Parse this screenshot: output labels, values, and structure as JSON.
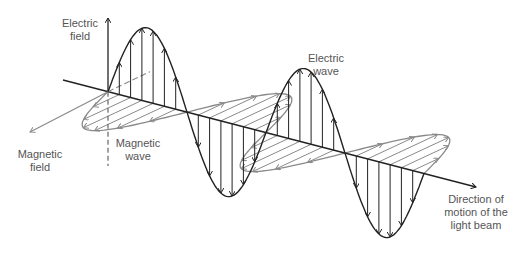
{
  "labels": {
    "electric_field": "Electric\nfield",
    "magnetic_field": "Magnetic\nfield",
    "magnetic_wave": "Magnetic\nwave",
    "electric_wave": "Electric\nwave",
    "direction": "Direction of\nmotion of the\nlight beam"
  },
  "colors": {
    "electric": "#222222",
    "magnetic": "#8a8a8a",
    "axis": "#222222",
    "text": "#555555"
  },
  "geometry": {
    "axis_start": [
      63,
      80
    ],
    "axis_end": [
      476,
      187
    ],
    "origin_x": 108,
    "half_period_x": 79,
    "half_cycles": 4,
    "electric_amplitude": 74,
    "magnetic_vector": [
      -60,
      28
    ],
    "electric_axis_top": [
      108,
      18
    ],
    "electric_axis_bottom": [
      108,
      166
    ],
    "magnetic_axis_end": [
      30,
      132
    ],
    "arrows_per_half_cycle": 6
  }
}
